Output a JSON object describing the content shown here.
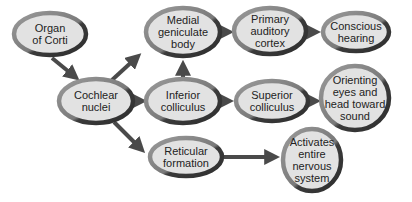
{
  "diagram": {
    "type": "flowchart",
    "colors": {
      "fill": "#e2e2e2",
      "ring_light": "#8f8f8f",
      "ring_dark": "#3b3b3b",
      "arrow": "#4a4a4a"
    },
    "nodes": [
      {
        "id": "organ_of_corti",
        "label": "Organ\nof Corti"
      },
      {
        "id": "cochlear_nuclei",
        "label": "Cochlear\nnuclei"
      },
      {
        "id": "medial_geniculate",
        "label": "Medial\ngeniculate\nbody"
      },
      {
        "id": "primary_auditory_cortex",
        "label": "Primary\nauditory\ncortex"
      },
      {
        "id": "conscious_hearing",
        "label": "Conscious\nhearing"
      },
      {
        "id": "inferior_colliculus",
        "label": "Inferior\ncolliculus"
      },
      {
        "id": "superior_colliculus",
        "label": "Superior\ncolliculus"
      },
      {
        "id": "orienting",
        "label": "Orienting\neyes and\nhead toward\nsound"
      },
      {
        "id": "reticular_formation",
        "label": "Reticular\nformation"
      },
      {
        "id": "activates",
        "label": "Activates\nentire\nnervous\nsystem"
      }
    ],
    "edges": [
      {
        "from": "organ_of_corti",
        "to": "cochlear_nuclei"
      },
      {
        "from": "cochlear_nuclei",
        "to": "medial_geniculate"
      },
      {
        "from": "cochlear_nuclei",
        "to": "inferior_colliculus"
      },
      {
        "from": "cochlear_nuclei",
        "to": "reticular_formation"
      },
      {
        "from": "inferior_colliculus",
        "to": "medial_geniculate"
      },
      {
        "from": "medial_geniculate",
        "to": "primary_auditory_cortex"
      },
      {
        "from": "primary_auditory_cortex",
        "to": "conscious_hearing"
      },
      {
        "from": "inferior_colliculus",
        "to": "superior_colliculus"
      },
      {
        "from": "superior_colliculus",
        "to": "orienting"
      },
      {
        "from": "reticular_formation",
        "to": "activates"
      }
    ]
  }
}
